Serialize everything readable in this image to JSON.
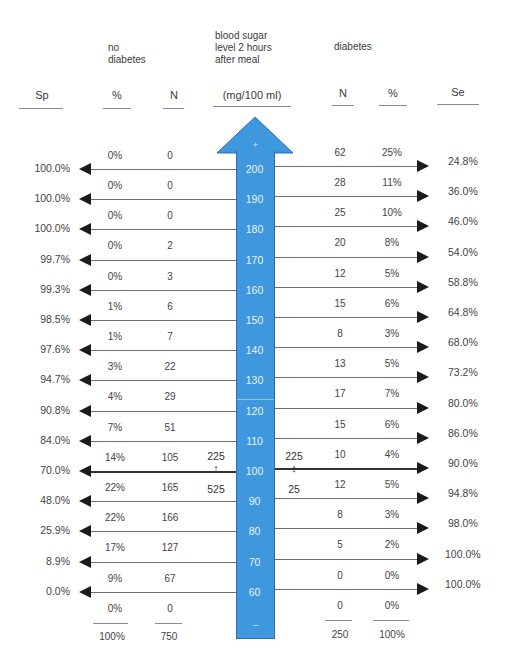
{
  "headers": {
    "no_diabetes": "no\ndiabetes",
    "blood_sugar": "blood sugar\nlevel 2 hours\nafter meal",
    "diabetes": "diabetes"
  },
  "columns": {
    "sp": "Sp",
    "nd_pct": "%",
    "nd_n": "N",
    "unit": "(mg/100 ml)",
    "d_n": "N",
    "d_pct": "%",
    "se": "Se"
  },
  "arrow": {
    "color": "#3f97de",
    "top_symbol": "+",
    "bottom_symbol": "–",
    "ticks": [
      "200",
      "190",
      "180",
      "170",
      "160",
      "150",
      "140",
      "130",
      "120",
      "110",
      "100",
      "90",
      "80",
      "70",
      "60"
    ]
  },
  "bands": [
    {
      "nd_pct": "0%",
      "nd_n": "0",
      "d_n": "62",
      "d_pct": "25%"
    },
    {
      "nd_pct": "0%",
      "nd_n": "0",
      "d_n": "28",
      "d_pct": "11%"
    },
    {
      "nd_pct": "0%",
      "nd_n": "0",
      "d_n": "25",
      "d_pct": "10%"
    },
    {
      "nd_pct": "0%",
      "nd_n": "2",
      "d_n": "20",
      "d_pct": "8%"
    },
    {
      "nd_pct": "0%",
      "nd_n": "3",
      "d_n": "12",
      "d_pct": "5%"
    },
    {
      "nd_pct": "1%",
      "nd_n": "6",
      "d_n": "15",
      "d_pct": "6%"
    },
    {
      "nd_pct": "1%",
      "nd_n": "7",
      "d_n": "8",
      "d_pct": "3%"
    },
    {
      "nd_pct": "3%",
      "nd_n": "22",
      "d_n": "13",
      "d_pct": "5%"
    },
    {
      "nd_pct": "4%",
      "nd_n": "29",
      "d_n": "17",
      "d_pct": "7%"
    },
    {
      "nd_pct": "7%",
      "nd_n": "51",
      "d_n": "15",
      "d_pct": "6%"
    },
    {
      "nd_pct": "14%",
      "nd_n": "105",
      "d_n": "10",
      "d_pct": "4%"
    },
    {
      "nd_pct": "22%",
      "nd_n": "165",
      "d_n": "12",
      "d_pct": "5%"
    },
    {
      "nd_pct": "22%",
      "nd_n": "166",
      "d_n": "8",
      "d_pct": "3%"
    },
    {
      "nd_pct": "17%",
      "nd_n": "127",
      "d_n": "5",
      "d_pct": "2%"
    },
    {
      "nd_pct": "9%",
      "nd_n": "67",
      "d_n": "0",
      "d_pct": "0%"
    },
    {
      "nd_pct": "0%",
      "nd_n": "0",
      "d_n": "0",
      "d_pct": "0%"
    }
  ],
  "thresholds": [
    {
      "value": "200",
      "sp": "100.0%",
      "se": "24.8%"
    },
    {
      "value": "190",
      "sp": "100.0%",
      "se": "36.0%"
    },
    {
      "value": "180",
      "sp": "100.0%",
      "se": "46.0%"
    },
    {
      "value": "170",
      "sp": "99.7%",
      "se": "54.0%"
    },
    {
      "value": "160",
      "sp": "99.3%",
      "se": "58.8%"
    },
    {
      "value": "150",
      "sp": "98.5%",
      "se": "64.8%"
    },
    {
      "value": "140",
      "sp": "97.6%",
      "se": "68.0%"
    },
    {
      "value": "130",
      "sp": "94.7%",
      "se": "73.2%"
    },
    {
      "value": "120",
      "sp": "90.8%",
      "se": "80.0%"
    },
    {
      "value": "110",
      "sp": "84.0%",
      "se": "86.0%"
    },
    {
      "value": "100",
      "sp": "70.0%",
      "se": "90.0%"
    },
    {
      "value": "90",
      "sp": "48.0%",
      "se": "94.8%"
    },
    {
      "value": "80",
      "sp": "25.9%",
      "se": "98.0%"
    },
    {
      "value": "70",
      "sp": "8.9%",
      "se": "100.0%"
    },
    {
      "value": "60",
      "sp": "0.0%",
      "se": "100.0%"
    }
  ],
  "cutoff_annotation": {
    "left_above": "225",
    "left_below": "525",
    "right_above": "225",
    "right_below": "25",
    "up_down_symbol": "↕"
  },
  "totals": {
    "nd_pct": "100%",
    "nd_n": "750",
    "d_n": "250",
    "d_pct": "100%"
  }
}
